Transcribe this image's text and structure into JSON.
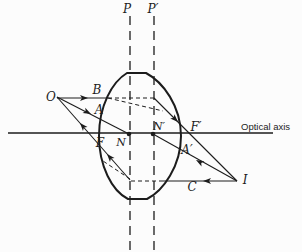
{
  "figure": {
    "background": "#fcfcfc",
    "line_color": "#1c1c1c",
    "labels": {
      "principal_plane_1": "P",
      "principal_plane_2": "P′",
      "object_point": "O",
      "image_point": "I",
      "ray_b": "B",
      "ray_a": "A",
      "ray_c": "C",
      "ray_a_prime": "A′",
      "nodal_point_1": "N",
      "nodal_point_2": "N′",
      "focal_point_1": "F",
      "focal_point_2": "F′",
      "axis": "Optical axis"
    }
  }
}
